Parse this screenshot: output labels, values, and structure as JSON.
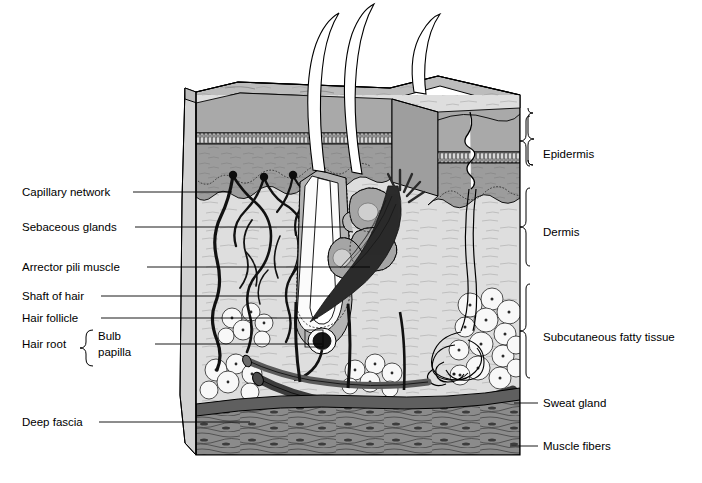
{
  "figure": {
    "kind": "anatomical-cross-section"
  },
  "labels_left": [
    {
      "id": "capillary-network",
      "text": "Capillary network",
      "x": 22,
      "y": 196,
      "line": {
        "x1": 133,
        "y1": 192,
        "x2": 232,
        "y2": 192
      }
    },
    {
      "id": "sebaceous-glands",
      "text": "Sebaceous glands",
      "x": 22,
      "y": 231,
      "line": {
        "x1": 135,
        "y1": 227,
        "x2": 345,
        "y2": 227
      }
    },
    {
      "id": "arrector-pili",
      "text": "Arrector pili muscle",
      "x": 22,
      "y": 271,
      "line": {
        "x1": 147,
        "y1": 267,
        "x2": 370,
        "y2": 267
      }
    },
    {
      "id": "shaft-of-hair",
      "text": "Shaft of hair",
      "x": 22,
      "y": 300,
      "line": {
        "x1": 101,
        "y1": 296,
        "x2": 330,
        "y2": 296
      }
    },
    {
      "id": "hair-follicle",
      "text": "Hair follicle",
      "x": 22,
      "y": 322,
      "line": {
        "x1": 101,
        "y1": 318,
        "x2": 318,
        "y2": 318
      }
    },
    {
      "id": "hair-root",
      "text": "Hair root",
      "x": 22,
      "y": 348,
      "line": null
    }
  ],
  "hair_root_group": {
    "bracket_label": "Hair root",
    "items": [
      {
        "id": "bulb",
        "text": "Bulb",
        "x": 98,
        "y": 340
      },
      {
        "id": "papilla",
        "text": "papilla",
        "x": 98,
        "y": 356
      }
    ],
    "line": {
      "x1": 155,
      "y1": 344,
      "x2": 322,
      "y2": 344
    }
  },
  "label_deep_fascia": {
    "id": "deep-fascia",
    "text": "Deep fascia",
    "x": 22,
    "y": 426,
    "line": {
      "x1": 99,
      "y1": 422,
      "x2": 250,
      "y2": 422
    }
  },
  "labels_right": [
    {
      "id": "epidermis",
      "text": "Epidermis",
      "x": 543,
      "y": 158,
      "brace": {
        "top": 116,
        "bottom": 186,
        "x": 528,
        "tipx": 537
      }
    },
    {
      "id": "dermis",
      "text": "Dermis",
      "x": 543,
      "y": 236,
      "brace": {
        "top": 188,
        "bottom": 282,
        "x": 528,
        "tipx": 537
      }
    },
    {
      "id": "subcutaneous",
      "text": "Subcutaneous fatty tissue",
      "x": 543,
      "y": 341,
      "brace": {
        "top": 284,
        "bottom": 394,
        "x": 528,
        "tipx": 537
      }
    },
    {
      "id": "sweat-gland",
      "text": "Sweat gland",
      "x": 543,
      "y": 407,
      "line": {
        "x1": 520,
        "y1": 403,
        "x2": 538,
        "y2": 403
      }
    },
    {
      "id": "muscle-fibers",
      "text": "Muscle fibers",
      "x": 543,
      "y": 450,
      "line": {
        "x1": 515,
        "y1": 446,
        "x2": 538,
        "y2": 446
      }
    }
  ],
  "colors": {
    "stratum_corneum": "#b9b9b9",
    "granular_band": "#8f8f8f",
    "epidermis_deep": "#9a9a9a",
    "dermis": "#dcdcdc",
    "side_face": "#cccccc",
    "top_face": "#bdbdbd",
    "fat": "#f4f4f4",
    "fascia": "#6b6b6b",
    "muscle": "#8d8d8d",
    "arrector_pili": "#2b2b2b",
    "vessel": "#111111",
    "outline": "#000000",
    "background": "#ffffff"
  }
}
